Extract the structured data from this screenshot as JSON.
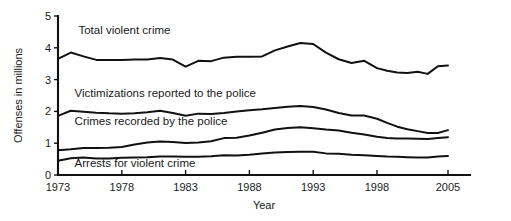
{
  "chart_data": {
    "type": "line",
    "title": "",
    "xlabel": "Year",
    "ylabel": "Offenses in millions",
    "xlim": [
      1973,
      2005
    ],
    "ylim": [
      0,
      5
    ],
    "yticks": [
      0,
      1,
      2,
      3,
      4,
      5
    ],
    "xticks": [
      1973,
      1978,
      1983,
      1988,
      1993,
      1998,
      2005
    ],
    "ytick_labels": [
      "0",
      "1",
      "2",
      "3",
      "4",
      "5"
    ],
    "xtick_labels": [
      "1973",
      "1978",
      "1983",
      "1988",
      "1993",
      "1998",
      "2005"
    ],
    "grid": false,
    "legend": "inline-labels",
    "x": [
      1973,
      1974,
      1975,
      1976,
      1977,
      1978,
      1979,
      1980,
      1981,
      1982,
      1983,
      1984,
      1985,
      1986,
      1987,
      1988,
      1989,
      1990,
      1991,
      1992,
      1993,
      1994,
      1995,
      1996,
      1997,
      1998,
      1999,
      2000,
      2001,
      2002,
      2003,
      2004,
      2005
    ],
    "series": [
      {
        "name": "Total violent crime",
        "label": "Total violent crime",
        "label_x": 1974.6,
        "label_y": 4.42,
        "values": [
          3.65,
          3.85,
          3.73,
          3.62,
          3.62,
          3.62,
          3.63,
          3.63,
          3.68,
          3.63,
          3.41,
          3.59,
          3.58,
          3.69,
          3.72,
          3.72,
          3.73,
          3.92,
          4.04,
          4.15,
          4.12,
          3.85,
          3.64,
          3.52,
          3.59,
          3.36,
          3.28,
          3.22,
          3.21,
          3.25,
          3.18,
          3.42,
          3.44
        ]
      },
      {
        "name": "Victimizations reported to the police",
        "label": "Victimizations reported to the police",
        "label_x": 1974.3,
        "label_y": 2.46,
        "values": [
          1.86,
          2.02,
          1.99,
          1.96,
          1.94,
          1.93,
          1.94,
          1.97,
          2.02,
          1.95,
          1.86,
          1.93,
          1.92,
          1.95,
          2.0,
          2.04,
          2.07,
          2.11,
          2.15,
          2.17,
          2.14,
          2.06,
          1.95,
          1.87,
          1.87,
          1.77,
          1.64,
          1.52,
          1.44,
          1.38,
          1.32,
          1.32,
          1.41
        ]
      },
      {
        "name": "Crimes recorded by the police",
        "label": "Crimes recorded by the police",
        "label_x": 1974.3,
        "label_y": 1.57,
        "values": [
          0.78,
          0.81,
          0.85,
          0.85,
          0.86,
          0.88,
          0.96,
          1.02,
          1.05,
          1.04,
          1.01,
          1.02,
          1.06,
          1.16,
          1.17,
          1.24,
          1.33,
          1.43,
          1.48,
          1.5,
          1.47,
          1.43,
          1.4,
          1.33,
          1.27,
          1.2,
          1.16,
          1.15,
          1.15,
          1.14,
          1.13,
          1.16,
          1.19
        ]
      },
      {
        "name": "Arrests for violent crime",
        "label": "Arrests for violent crime",
        "label_x": 1974.3,
        "label_y": 0.26,
        "values": [
          0.45,
          0.53,
          0.55,
          0.52,
          0.52,
          0.54,
          0.55,
          0.56,
          0.58,
          0.58,
          0.57,
          0.57,
          0.59,
          0.62,
          0.61,
          0.64,
          0.68,
          0.71,
          0.72,
          0.73,
          0.73,
          0.68,
          0.67,
          0.64,
          0.62,
          0.6,
          0.58,
          0.57,
          0.56,
          0.55,
          0.55,
          0.58,
          0.6
        ]
      }
    ]
  },
  "colors": {
    "line": "#111111",
    "text": "#1a1a1a",
    "background": "#ffffff"
  }
}
